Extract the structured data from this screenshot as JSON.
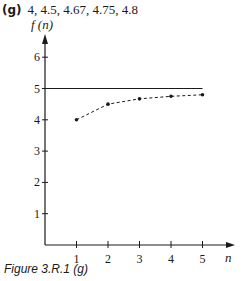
{
  "header": {
    "part_label": "(g)",
    "sequence_text": "4, 4.5, 4.67, 4.75, 4.8"
  },
  "caption": "Figure 3.R.1 (g)",
  "chart_data": {
    "type": "scatter",
    "title": "",
    "xlabel": "n",
    "ylabel": "f (n)",
    "x": [
      1,
      2,
      3,
      4,
      5
    ],
    "series": [
      {
        "name": "f(n)",
        "values": [
          4,
          4.5,
          4.67,
          4.75,
          4.8
        ],
        "style": "dashed-line-with-points"
      }
    ],
    "reference_lines": [
      {
        "type": "horizontal",
        "y": 5,
        "x_range": [
          0,
          5
        ]
      }
    ],
    "x_ticks": [
      "1",
      "2",
      "3",
      "4",
      "5"
    ],
    "y_ticks": [
      "1",
      "2",
      "3",
      "4",
      "5",
      "6"
    ],
    "xlim": [
      0,
      6
    ],
    "ylim": [
      0,
      7
    ],
    "grid": false,
    "legend": "none"
  },
  "colors": {
    "ink": "#1a1a1a",
    "background": "#ffffff"
  }
}
